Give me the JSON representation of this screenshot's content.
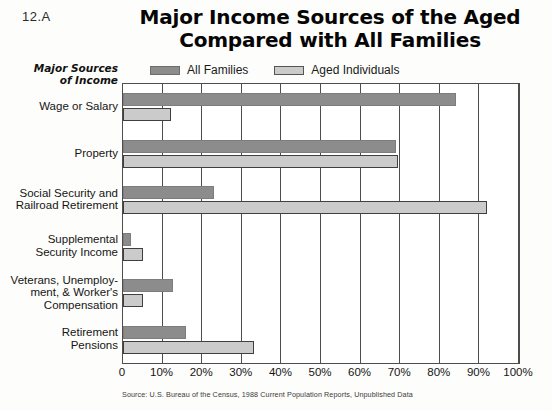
{
  "page_label": "12.A",
  "title": {
    "line1": "Major Income Sources of the Aged",
    "line2": "Compared with All Families"
  },
  "y_axis_title": {
    "line1": "Major Sources",
    "line2": "of Income"
  },
  "legend": [
    {
      "label": "All Families",
      "color": "#8c8c8c",
      "key": "all_families"
    },
    {
      "label": "Aged Individuals",
      "color": "#cbcbcb",
      "key": "aged_individuals"
    }
  ],
  "source_note": "Source: U.S. Bureau of the Census, 1988 Current Population Reports, Unpublished Data",
  "chart_data": {
    "type": "bar",
    "orientation": "horizontal",
    "title": "Major Income Sources of the Aged Compared with All Families",
    "xlabel": "",
    "ylabel": "Major Sources of Income",
    "xlim": [
      0,
      100
    ],
    "grid": true,
    "legend_position": "top",
    "tick_labels": [
      "0",
      "10%",
      "20%",
      "30%",
      "40%",
      "50%",
      "60%",
      "70%",
      "80%",
      "90%",
      "100%"
    ],
    "tick_values": [
      0,
      10,
      20,
      30,
      40,
      50,
      60,
      70,
      80,
      90,
      100
    ],
    "categories": [
      "Wage or Salary",
      "Property",
      "Social Security and Railroad Retirement",
      "Supplemental Security Income",
      "Veterans, Unemployment, & Worker's Compensation",
      "Retirement Pensions"
    ],
    "category_label_lines": [
      [
        "Wage or Salary"
      ],
      [
        "Property"
      ],
      [
        "Social Security and",
        "Railroad Retirement"
      ],
      [
        "Supplemental",
        "Security Income"
      ],
      [
        "Veterans, Unemploy-",
        "ment, & Worker's",
        "Compensation"
      ],
      [
        "Retirement",
        "Pensions"
      ]
    ],
    "series": [
      {
        "name": "All Families",
        "color": "#8c8c8c",
        "values": [
          84,
          69,
          23,
          2,
          12.5,
          16
        ]
      },
      {
        "name": "Aged Individuals",
        "color": "#cbcbcb",
        "values": [
          12,
          69.5,
          92,
          5,
          5,
          33
        ]
      }
    ]
  }
}
